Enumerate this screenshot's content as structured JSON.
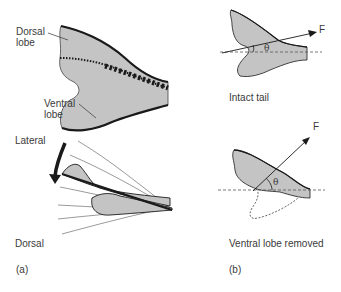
{
  "panel_a": {
    "panel_label": "(a)",
    "top_figure": {
      "dorsal_lobe_label": "Dorsal\nlobe",
      "ventral_lobe_label": "Ventral\nlobe"
    },
    "bottom_figure": {
      "lateral_label": "Lateral",
      "dorsal_label": "Dorsal"
    }
  },
  "panel_b": {
    "panel_label": "(b)",
    "intact": {
      "caption": "Intact tail",
      "force_label": "F",
      "angle_label": "θ"
    },
    "removed": {
      "caption": "Ventral lobe removed",
      "force_label": "F",
      "angle_label": "θ"
    }
  },
  "colors": {
    "fill": "#c4c4c4",
    "stroke": "#1a1a1a",
    "text": "#3a3a3a"
  }
}
